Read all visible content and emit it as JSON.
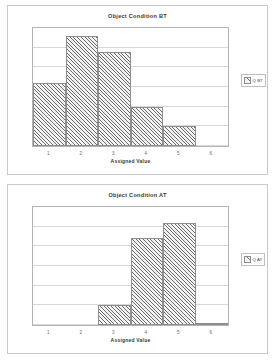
{
  "charts": [
    {
      "id": "bt",
      "title": "Object Condition BT",
      "xlabel": "Assigned Value",
      "legend_label": "Q BT",
      "categories": [
        "1",
        "2",
        "3",
        "4",
        "5",
        "6"
      ],
      "values": [
        8,
        14,
        12,
        5,
        2.5,
        0
      ]
    },
    {
      "id": "at",
      "title": "Object Condition AT",
      "xlabel": "Assigned Value",
      "legend_label": "Q AT",
      "categories": [
        "1",
        "2",
        "3",
        "4",
        "5",
        "6"
      ],
      "values": [
        0,
        0,
        2.5,
        11,
        13,
        0.3
      ]
    }
  ],
  "chart_data": [
    {
      "type": "bar",
      "title": "Object Condition BT",
      "xlabel": "Assigned Value",
      "ylabel": "",
      "categories": [
        "1",
        "2",
        "3",
        "4",
        "5",
        "6"
      ],
      "values": [
        8,
        14,
        12,
        5,
        2.5,
        0
      ],
      "series": [
        {
          "name": "Q BT",
          "values": [
            8,
            14,
            12,
            5,
            2.5,
            0
          ]
        }
      ],
      "ylim": [
        0,
        15
      ],
      "yticks": [
        0,
        2.5,
        5,
        7.5,
        10,
        12.5,
        15
      ],
      "grid": true,
      "legend": [
        "Q BT"
      ],
      "legend_position": "right"
    },
    {
      "type": "bar",
      "title": "Object Condition AT",
      "xlabel": "Assigned Value",
      "ylabel": "",
      "categories": [
        "1",
        "2",
        "3",
        "4",
        "5",
        "6"
      ],
      "values": [
        0,
        0,
        2.5,
        11,
        13,
        0.3
      ],
      "series": [
        {
          "name": "Q AT",
          "values": [
            0,
            0,
            2.5,
            11,
            13,
            0.3
          ]
        }
      ],
      "ylim": [
        0,
        15
      ],
      "yticks": [
        0,
        2.5,
        5,
        7.5,
        10,
        12.5,
        15
      ],
      "grid": true,
      "legend": [
        "Q AT"
      ],
      "legend_position": "right"
    }
  ]
}
